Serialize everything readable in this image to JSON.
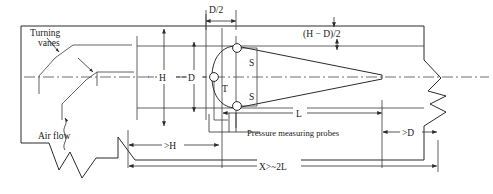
{
  "figure": {
    "type": "engineering-schematic",
    "background_color": "#ffffff",
    "line_color": "#2b2b2b"
  },
  "labels": {
    "turning_vanes": "Turning\nvanes",
    "turning_vanes_line1": "Turning",
    "turning_vanes_line2": "vanes",
    "air_flow": "Air flow",
    "pressure_probes": "Pressure measuring probes",
    "probe_static_top": "S",
    "probe_static_bottom": "S",
    "probe_total": "T"
  },
  "dimensions": {
    "tunnel_height": "H",
    "body_diameter": "D",
    "half_diameter": "D/2",
    "gap_each_side": "(H − D)/2",
    "body_length": "L",
    "upstream_distance": ">H",
    "downstream_distance": ">D",
    "total_length": "X>~2L"
  },
  "annotation_symbols": {
    "break_symbol": "zigzag-break",
    "centerline_style": "dash-dot",
    "arrow_style": "filled-triangle"
  }
}
